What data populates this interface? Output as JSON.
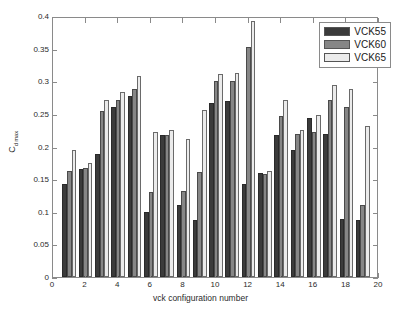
{
  "chart_data": {
    "type": "bar",
    "title": "",
    "subtitle": "",
    "xlabel": "vck configuration number",
    "ylabel": "C_d max",
    "ylabel_base": "C",
    "ylabel_sub": "d max",
    "xlim": [
      0,
      20
    ],
    "ylim": [
      0,
      0.4
    ],
    "xticks": [
      0,
      2,
      4,
      6,
      8,
      10,
      12,
      14,
      16,
      18,
      20
    ],
    "yticks": [
      0,
      0.05,
      0.1,
      0.15,
      0.2,
      0.25,
      0.3,
      0.35,
      0.4
    ],
    "ytick_labels": [
      "0",
      "0.05",
      "0.1",
      "0.15",
      "0.2",
      "0.25",
      "0.3",
      "0.35",
      "0.4"
    ],
    "xtick_labels": [
      "0",
      "2",
      "4",
      "6",
      "8",
      "10",
      "12",
      "14",
      "16",
      "18",
      "20"
    ],
    "grid": false,
    "legend_position": "top-right",
    "categories": [
      1,
      2,
      3,
      4,
      5,
      6,
      7,
      8,
      9,
      10,
      11,
      12,
      13,
      14,
      15,
      16,
      17,
      18,
      19
    ],
    "series": [
      {
        "name": "VCK55",
        "color": "#3b3b3b",
        "values": [
          0.143,
          0.165,
          0.189,
          0.26,
          0.278,
          0.099,
          0.217,
          0.11,
          0.088,
          0.267,
          0.269,
          0.142,
          0.16,
          0.218,
          0.195,
          0.244,
          0.219,
          0.089,
          0.088
        ]
      },
      {
        "name": "VCK60",
        "color": "#868686",
        "values": [
          0.163,
          0.167,
          0.254,
          0.272,
          0.288,
          0.13,
          0.217,
          0.132,
          0.161,
          0.3,
          0.301,
          0.353,
          0.158,
          0.247,
          0.219,
          0.222,
          0.272,
          0.261,
          0.111
        ]
      },
      {
        "name": "VCK65",
        "color": "#ebebeb",
        "values": [
          0.194,
          0.175,
          0.271,
          0.283,
          0.308,
          0.222,
          0.226,
          0.211,
          0.256,
          0.311,
          0.313,
          0.392,
          0.163,
          0.271,
          0.226,
          0.248,
          0.295,
          0.288,
          0.231
        ]
      }
    ]
  },
  "legend": {
    "items": [
      {
        "label": "VCK55",
        "color": "#3b3b3b"
      },
      {
        "label": "VCK60",
        "color": "#868686"
      },
      {
        "label": "VCK65",
        "color": "#ebebeb"
      }
    ]
  },
  "axes": {
    "x_title": "vck configuration number",
    "y_title_base": "C",
    "y_title_sub": "d max"
  },
  "colors": {
    "series1": "#3b3b3b",
    "series2": "#868686",
    "series3": "#ebebeb",
    "axis": "#8a8a8a",
    "text": "#2b2b2b",
    "background": "#ffffff"
  }
}
